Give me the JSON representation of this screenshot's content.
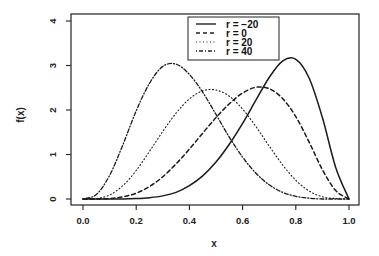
{
  "chart_data": {
    "type": "line",
    "title": "",
    "xlabel": "x",
    "ylabel": "f(x)",
    "xlim": [
      0.0,
      1.0
    ],
    "ylim": [
      0,
      4
    ],
    "xticks": [
      "0.0",
      "0.2",
      "0.4",
      "0.6",
      "0.8",
      "1.0"
    ],
    "yticks": [
      "0",
      "1",
      "2",
      "3",
      "4"
    ],
    "grid": false,
    "legend_position": "top-center",
    "x": [
      0.0,
      0.05,
      0.1,
      0.15,
      0.2,
      0.25,
      0.3,
      0.35,
      0.4,
      0.45,
      0.5,
      0.55,
      0.6,
      0.65,
      0.7,
      0.75,
      0.8,
      0.85,
      0.9,
      0.95,
      1.0
    ],
    "series": [
      {
        "name": "r = −20",
        "style": "solid",
        "values": [
          0,
          0,
          0,
          0,
          0.01,
          0.03,
          0.07,
          0.15,
          0.3,
          0.52,
          0.83,
          1.23,
          1.7,
          2.22,
          2.73,
          3.1,
          3.14,
          2.72,
          1.83,
          0.71,
          0
        ]
      },
      {
        "name": "r = 0",
        "style": "dashed",
        "values": [
          0,
          0,
          0.01,
          0.05,
          0.13,
          0.28,
          0.5,
          0.79,
          1.12,
          1.48,
          1.83,
          2.14,
          2.38,
          2.51,
          2.48,
          2.26,
          1.85,
          1.28,
          0.66,
          0.19,
          0
        ]
      },
      {
        "name": "r = 20",
        "style": "dotted",
        "values": [
          0,
          0.01,
          0.09,
          0.3,
          0.64,
          1.07,
          1.52,
          1.93,
          2.25,
          2.43,
          2.45,
          2.31,
          2.02,
          1.63,
          1.19,
          0.77,
          0.42,
          0.18,
          0.05,
          0.01,
          0
        ]
      },
      {
        "name": "r = 40",
        "style": "dashdot",
        "values": [
          0,
          0.1,
          0.53,
          1.22,
          1.98,
          2.6,
          2.98,
          3.03,
          2.8,
          2.4,
          1.9,
          1.39,
          0.94,
          0.58,
          0.32,
          0.15,
          0.06,
          0.02,
          0,
          0,
          0
        ]
      }
    ]
  },
  "legend": {
    "items": [
      "r = −20",
      "r = 0",
      "r = 20",
      "r = 40"
    ]
  },
  "axes": {
    "xlabel": "x",
    "ylabel": "f(x)"
  }
}
